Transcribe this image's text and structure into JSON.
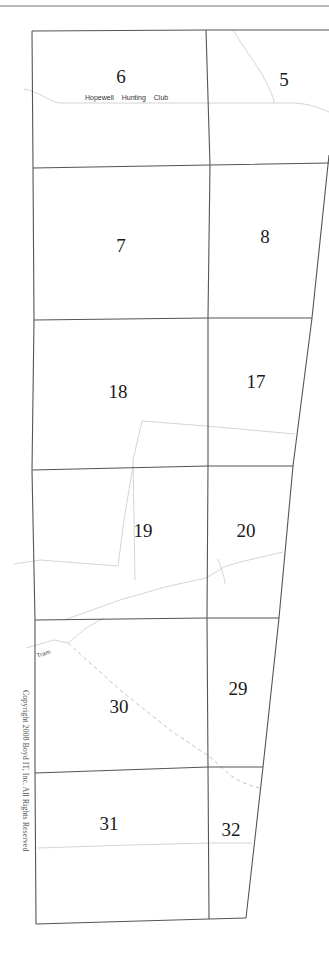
{
  "map": {
    "sections": [
      {
        "number": "6",
        "x": 121,
        "y": 77
      },
      {
        "number": "5",
        "x": 284,
        "y": 80
      },
      {
        "number": "7",
        "x": 121,
        "y": 246
      },
      {
        "number": "8",
        "x": 265,
        "y": 237
      },
      {
        "number": "18",
        "x": 118,
        "y": 392
      },
      {
        "number": "17",
        "x": 256,
        "y": 382
      },
      {
        "number": "19",
        "x": 143,
        "y": 531
      },
      {
        "number": "20",
        "x": 246,
        "y": 531
      },
      {
        "number": "30",
        "x": 119,
        "y": 707
      },
      {
        "number": "29",
        "x": 238,
        "y": 689
      },
      {
        "number": "31",
        "x": 109,
        "y": 824
      },
      {
        "number": "32",
        "x": 231,
        "y": 830
      }
    ],
    "place_label": {
      "text": "Hopewell Hunting Club",
      "x": 85,
      "y": 94
    },
    "road_label": {
      "text": "Tram",
      "x": 36,
      "y": 651
    },
    "copyright": {
      "text": "Copyright 2008 Boyd IT, Inc. All Rights Reserved",
      "x": 38,
      "y": 690
    },
    "colors": {
      "boundary": "#555555",
      "road": "#c8c8c8",
      "trail": "#c0c0c0",
      "background": "#ffffff"
    }
  }
}
